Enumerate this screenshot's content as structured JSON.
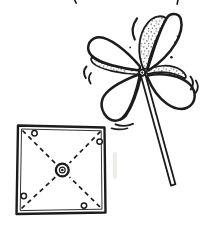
{
  "meta": {
    "ink_color": "#1c1c1c",
    "paper_color": "#ffffff"
  },
  "pinwheel": {
    "blade_count": 4,
    "blade_shading": "stippled dots on the curled face of each blade",
    "hub": "white button with center pin",
    "handle": "thin straight stick angled toward lower right",
    "motion_marks_count": 7
  },
  "template_square": {
    "border": "double-line hand-drawn square outline",
    "fold_lines": "dashed diagonals running from each corner to the center",
    "fold_line_count": 4,
    "corner_hole_count": 4,
    "center_fastener": "concentric grommet circles with a center dot"
  }
}
